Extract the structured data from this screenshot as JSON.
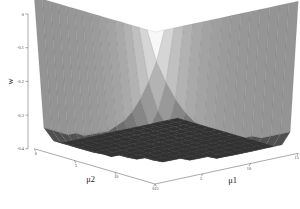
{
  "figure": {
    "kind": "3d-surface-plot",
    "background_color": "#ffffff",
    "colormap": "gray"
  },
  "axes": {
    "z": {
      "title": "w",
      "ticks": [
        "0",
        "-0.1",
        "-0.2",
        "-0.3",
        "-0.4"
      ],
      "tick_values": [
        0,
        -0.1,
        -0.2,
        -0.3,
        -0.4
      ]
    },
    "x": {
      "title": "μ1",
      "ticks": [
        "0",
        "5",
        "10",
        "15"
      ],
      "tick_values": [
        0,
        5,
        10,
        15
      ]
    },
    "y": {
      "title": "μ2",
      "ticks": [
        "15",
        "10",
        "5",
        "0"
      ],
      "tick_values": [
        15,
        10,
        5,
        0
      ]
    }
  },
  "chart_data": {
    "type": "surface",
    "title": "",
    "xlabel": "μ1",
    "ylabel": "μ2",
    "zlabel": "w",
    "grid": true,
    "legend": "none",
    "xlim": [
      0,
      15
    ],
    "ylim": [
      0,
      15
    ],
    "zlim": [
      -0.4,
      0.0
    ],
    "x": [
      0,
      1,
      2,
      3,
      4,
      5,
      6,
      7,
      8,
      9,
      10,
      11,
      12,
      13,
      14,
      15
    ],
    "y": [
      0,
      1,
      2,
      3,
      4,
      5,
      6,
      7,
      8,
      9,
      10,
      11,
      12,
      13,
      14,
      15
    ],
    "z": [
      [
        0.0,
        0.0,
        0.0,
        0.0,
        0.0,
        0.0,
        0.0,
        0.0,
        0.0,
        0.0,
        0.0,
        0.0,
        0.0,
        0.0,
        0.0,
        0.0
      ],
      [
        0.0,
        -0.09,
        -0.15,
        -0.2,
        -0.24,
        -0.27,
        -0.29,
        -0.31,
        -0.32,
        -0.33,
        -0.34,
        -0.34,
        -0.35,
        -0.35,
        -0.35,
        -0.35
      ],
      [
        0.0,
        -0.15,
        -0.23,
        -0.28,
        -0.32,
        -0.34,
        -0.36,
        -0.37,
        -0.38,
        -0.38,
        -0.39,
        -0.39,
        -0.39,
        -0.39,
        -0.39,
        -0.39
      ],
      [
        0.0,
        -0.2,
        -0.28,
        -0.33,
        -0.36,
        -0.37,
        -0.38,
        -0.39,
        -0.39,
        -0.4,
        -0.4,
        -0.4,
        -0.4,
        -0.4,
        -0.4,
        -0.4
      ],
      [
        0.0,
        -0.24,
        -0.32,
        -0.36,
        -0.38,
        -0.39,
        -0.39,
        -0.4,
        -0.4,
        -0.4,
        -0.4,
        -0.4,
        -0.4,
        -0.4,
        -0.4,
        -0.4
      ],
      [
        0.0,
        -0.27,
        -0.34,
        -0.37,
        -0.39,
        -0.4,
        -0.4,
        -0.4,
        -0.4,
        -0.4,
        -0.4,
        -0.4,
        -0.4,
        -0.4,
        -0.4,
        -0.4
      ],
      [
        0.0,
        -0.29,
        -0.36,
        -0.38,
        -0.39,
        -0.4,
        -0.4,
        -0.4,
        -0.4,
        -0.4,
        -0.4,
        -0.4,
        -0.4,
        -0.4,
        -0.4,
        -0.4
      ],
      [
        0.0,
        -0.31,
        -0.37,
        -0.39,
        -0.4,
        -0.4,
        -0.4,
        -0.4,
        -0.4,
        -0.4,
        -0.4,
        -0.4,
        -0.4,
        -0.4,
        -0.4,
        -0.4
      ],
      [
        0.0,
        -0.32,
        -0.38,
        -0.39,
        -0.4,
        -0.4,
        -0.4,
        -0.4,
        -0.4,
        -0.4,
        -0.4,
        -0.4,
        -0.4,
        -0.4,
        -0.4,
        -0.4
      ],
      [
        0.0,
        -0.33,
        -0.38,
        -0.4,
        -0.4,
        -0.4,
        -0.4,
        -0.4,
        -0.4,
        -0.4,
        -0.4,
        -0.4,
        -0.4,
        -0.4,
        -0.4,
        -0.4
      ],
      [
        0.0,
        -0.34,
        -0.39,
        -0.4,
        -0.4,
        -0.4,
        -0.4,
        -0.4,
        -0.4,
        -0.4,
        -0.4,
        -0.4,
        -0.4,
        -0.4,
        -0.4,
        -0.4
      ],
      [
        0.0,
        -0.34,
        -0.39,
        -0.4,
        -0.4,
        -0.4,
        -0.4,
        -0.4,
        -0.4,
        -0.4,
        -0.4,
        -0.4,
        -0.4,
        -0.4,
        -0.4,
        -0.4
      ],
      [
        0.0,
        -0.35,
        -0.39,
        -0.4,
        -0.4,
        -0.4,
        -0.4,
        -0.4,
        -0.4,
        -0.4,
        -0.4,
        -0.4,
        -0.4,
        -0.4,
        -0.4,
        -0.4
      ],
      [
        0.0,
        -0.35,
        -0.39,
        -0.4,
        -0.4,
        -0.4,
        -0.4,
        -0.4,
        -0.4,
        -0.4,
        -0.4,
        -0.4,
        -0.4,
        -0.4,
        -0.4,
        -0.4
      ],
      [
        0.0,
        -0.35,
        -0.39,
        -0.4,
        -0.4,
        -0.4,
        -0.4,
        -0.4,
        -0.4,
        -0.4,
        -0.4,
        -0.4,
        -0.4,
        -0.4,
        -0.4,
        -0.4
      ],
      [
        0.0,
        -0.35,
        -0.39,
        -0.4,
        -0.4,
        -0.4,
        -0.4,
        -0.4,
        -0.4,
        -0.4,
        -0.4,
        -0.4,
        -0.4,
        -0.4,
        -0.4,
        -0.4
      ]
    ]
  }
}
